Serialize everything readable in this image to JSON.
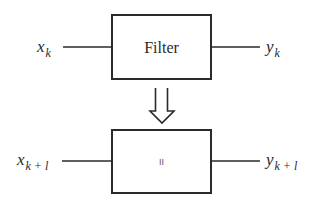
{
  "diagram": {
    "top_block": {
      "label": "Filter",
      "input": {
        "var": "x",
        "sub": "k"
      },
      "output": {
        "var": "y",
        "sub": "k"
      }
    },
    "transform_arrow": {
      "icon": "hollow-double-down-arrow-icon",
      "meaning": "implies"
    },
    "bottom_block": {
      "label": "II",
      "input": {
        "var": "x",
        "sub": "k + l"
      },
      "output": {
        "var": "y",
        "sub": "k + l"
      }
    },
    "colors": {
      "line": "#2a2a2a",
      "background": "#ffffff"
    }
  }
}
